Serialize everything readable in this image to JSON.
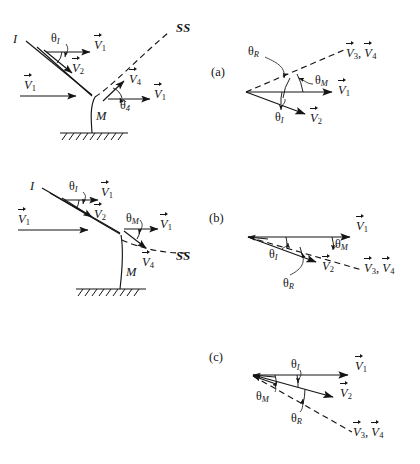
{
  "figure": {
    "type": "vector-velocity-diagram",
    "panels": [
      {
        "tag": "(a)",
        "tag_pos": {
          "x": 211,
          "y": 66
        },
        "sketch": {
          "jet_label": "I",
          "surface_label": "M",
          "streamline_label": "SS",
          "angles": [
            {
              "name": "theta-I",
              "symbol": "θ",
              "sub": "I",
              "x": 51,
              "y": 38
            },
            {
              "name": "theta-4",
              "symbol": "θ",
              "sub": "4",
              "x": 124,
              "y": 104
            }
          ],
          "vectors": [
            {
              "name": "V1-top",
              "symbol": "V",
              "sub": "1",
              "x": 97,
              "y": 43
            },
            {
              "name": "V2-top",
              "symbol": "V",
              "sub": "2",
              "x": 75,
              "y": 66
            },
            {
              "name": "V1-left",
              "symbol": "V",
              "sub": "1",
              "x": 25,
              "y": 83
            },
            {
              "name": "V4",
              "symbol": "V",
              "sub": "4",
              "x": 131,
              "y": 77
            },
            {
              "name": "V1-right",
              "symbol": "V",
              "sub": "1",
              "x": 157,
              "y": 92
            }
          ]
        },
        "vector_diagram": {
          "angles": [
            {
              "name": "theta-R",
              "symbol": "θ",
              "sub": "R",
              "x": 251,
              "y": 51
            },
            {
              "name": "theta-M",
              "symbol": "θ",
              "sub": "M",
              "x": 317,
              "y": 79
            },
            {
              "name": "theta-I",
              "symbol": "θ",
              "sub": "I",
              "x": 278,
              "y": 116
            }
          ],
          "vectors": [
            {
              "name": "V1",
              "symbol": "V",
              "sub": "1",
              "x": 341,
              "y": 88
            },
            {
              "name": "V2",
              "symbol": "V",
              "sub": "2",
              "x": 314,
              "y": 116
            },
            {
              "name": "V3-V4",
              "symbol": "V",
              "sub": "3",
              "symbol2": "V",
              "sub2": "4",
              "x": 349,
              "y": 53
            }
          ]
        }
      },
      {
        "tag": "(b)",
        "tag_pos": {
          "x": 209,
          "y": 212
        },
        "sketch": {
          "jet_label": "I",
          "surface_label": "M",
          "streamline_label": "SS",
          "angles": [
            {
              "name": "theta-I",
              "symbol": "θ",
              "sub": "I",
              "x": 71,
              "y": 185
            },
            {
              "name": "theta-M",
              "symbol": "θ",
              "sub": "M",
              "x": 129,
              "y": 217
            }
          ],
          "vectors": [
            {
              "name": "V1-top",
              "symbol": "V",
              "sub": "1",
              "x": 104,
              "y": 190
            },
            {
              "name": "V2-top",
              "symbol": "V",
              "sub": "2",
              "x": 97,
              "y": 212
            },
            {
              "name": "V1-left",
              "symbol": "V",
              "sub": "1",
              "x": 20,
              "y": 218
            },
            {
              "name": "V1-right",
              "symbol": "V",
              "sub": "1",
              "x": 163,
              "y": 223
            },
            {
              "name": "V4",
              "symbol": "V",
              "sub": "4",
              "x": 145,
              "y": 261
            }
          ]
        },
        "vector_diagram": {
          "angles": [
            {
              "name": "theta-I",
              "symbol": "θ",
              "sub": "I",
              "x": 272,
              "y": 253
            },
            {
              "name": "theta-M",
              "symbol": "θ",
              "sub": "M",
              "x": 337,
              "y": 242
            },
            {
              "name": "theta-R",
              "symbol": "θ",
              "sub": "R",
              "x": 286,
              "y": 281
            }
          ],
          "vectors": [
            {
              "name": "V1",
              "symbol": "V",
              "sub": "1",
              "x": 359,
              "y": 224
            },
            {
              "name": "V2",
              "symbol": "V",
              "sub": "2",
              "x": 325,
              "y": 264
            },
            {
              "name": "V3-V4",
              "symbol": "V",
              "sub": "3",
              "symbol2": "V",
              "sub2": "4",
              "x": 367,
              "y": 268
            }
          ]
        }
      },
      {
        "tag": "(c)",
        "tag_pos": {
          "x": 209,
          "y": 351
        },
        "vector_diagram": {
          "angles": [
            {
              "name": "theta-I",
              "symbol": "θ",
              "sub": "I",
              "x": 293,
              "y": 363
            },
            {
              "name": "theta-M",
              "symbol": "θ",
              "sub": "M",
              "x": 260,
              "y": 395
            },
            {
              "name": "theta-R",
              "symbol": "θ",
              "sub": "R",
              "x": 294,
              "y": 417
            }
          ],
          "vectors": [
            {
              "name": "V1",
              "symbol": "V",
              "sub": "1",
              "x": 358,
              "y": 364
            },
            {
              "name": "V2",
              "symbol": "V",
              "sub": "2",
              "x": 343,
              "y": 391
            },
            {
              "name": "V3-V4",
              "symbol": "V",
              "sub": "3",
              "symbol2": "V",
              "sub2": "4",
              "x": 356,
              "y": 432
            }
          ]
        }
      }
    ],
    "symbols": {
      "jet": "I",
      "surface": "M",
      "streamline": "SS",
      "theta": "θ",
      "velocity": "V"
    },
    "colors": {
      "stroke": "#151515",
      "background": "#ffffff"
    }
  }
}
